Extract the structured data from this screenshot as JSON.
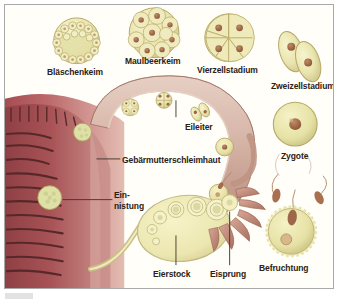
{
  "figure": {
    "language": "de",
    "colors": {
      "frame_border": "#a9a9a9",
      "background": "#fffef9",
      "label_text": "#2b2116",
      "cell_fill": "#e9e6b4",
      "cell_outline": "#b9ab6a",
      "nucleus": "#9b6647",
      "endometrium_dark": "#8e4murder",
      "uterus_pink": "#c98f92",
      "uterus_deep": "#9d4a4e",
      "ovary_fill": "#efecb9",
      "tube_fill": "#e4cdc2",
      "sperm": "#b07a5c"
    }
  },
  "labels": {
    "blastocyst": "Bläschenkeim",
    "morula": "Maulbeerkeim",
    "four_cell": "Vierzellstadium",
    "two_cell": "Zweizellstadium",
    "zygote": "Zygote",
    "fertilization": "Befruchtung",
    "fallopian_tube": "Eileiter",
    "endometrium": "Gebärmutterschleimhaut",
    "implantation_line1": "Ein-",
    "implantation_line2": "nistung",
    "ovary": "Eierstock",
    "ovulation": "Eisprung"
  },
  "stages": [
    {
      "id": "fertilization",
      "label": "Befruchtung",
      "order": 1
    },
    {
      "id": "zygote",
      "label": "Zygote",
      "order": 2
    },
    {
      "id": "two_cell",
      "label": "Zweizellstadium",
      "order": 3
    },
    {
      "id": "four_cell",
      "label": "Vierzellstadium",
      "order": 4
    },
    {
      "id": "morula",
      "label": "Maulbeerkeim",
      "order": 5
    },
    {
      "id": "blastocyst",
      "label": "Bläschenkeim",
      "order": 6
    },
    {
      "id": "implantation",
      "label": "Einnistung",
      "order": 7
    }
  ],
  "anatomy": [
    {
      "id": "fallopian_tube",
      "label": "Eileiter"
    },
    {
      "id": "endometrium",
      "label": "Gebärmutterschleimhaut"
    },
    {
      "id": "ovary",
      "label": "Eierstock"
    },
    {
      "id": "ovulation",
      "label": "Eisprung"
    }
  ]
}
